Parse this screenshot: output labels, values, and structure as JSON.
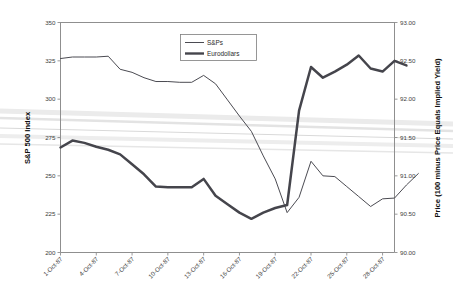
{
  "chart_data": {
    "type": "line",
    "title": "",
    "subtitle": "",
    "xlabel": "",
    "ylabel": "S&P 500 Index",
    "y2label": "Price (100 minus Price Equals Implied Yield)",
    "grid": false,
    "legend_position": "top-center",
    "ylim": [
      200,
      350
    ],
    "y2lim": [
      90.0,
      93.0
    ],
    "yticks": [
      "200",
      "225",
      "250",
      "275",
      "300",
      "325",
      "350"
    ],
    "ytick_values": [
      200,
      225,
      250,
      275,
      300,
      325,
      350
    ],
    "y2ticks": [
      "90.00",
      "90.50",
      "91.00",
      "91.50",
      "92.00",
      "92.50",
      "93.00"
    ],
    "y2tick_values": [
      90.0,
      90.5,
      91.0,
      91.5,
      92.0,
      92.5,
      93.0
    ],
    "xticks": [
      "1-Oct-87",
      "4-Oct-87",
      "7-Oct-87",
      "10-Oct-87",
      "13-Oct-87",
      "16-Oct-87",
      "19-Oct-87",
      "22-Oct-87",
      "25-Oct-87",
      "28-Oct-87"
    ],
    "xtick_index": [
      0,
      3,
      6,
      9,
      12,
      15,
      18,
      21,
      24,
      27
    ],
    "x_count": 29,
    "series": [
      {
        "name": "S&Ps",
        "axis": "left",
        "style": "thin",
        "color": "#4b4b52",
        "values": [
          326.5,
          327.5,
          327.5,
          327.5,
          328.0,
          319.5,
          317.5,
          314.0,
          311.5,
          311.5,
          311.0,
          311.0,
          315.5,
          310.0,
          299.5,
          289.0,
          279.0,
          263.0,
          248.0,
          226.0,
          236.0,
          259.5,
          250.0,
          249.5,
          243.0,
          236.5,
          230.0,
          235.0,
          235.5,
          244.0,
          251.5
        ]
      },
      {
        "name": "Eurodollars",
        "axis": "right",
        "style": "thick",
        "color": "#45454c",
        "values": [
          91.37,
          91.46,
          91.43,
          91.38,
          91.34,
          91.28,
          91.15,
          91.02,
          90.86,
          90.85,
          90.85,
          90.85,
          90.96,
          90.74,
          90.63,
          90.52,
          90.44,
          90.52,
          90.58,
          90.62,
          91.85,
          92.42,
          92.28,
          92.36,
          92.45,
          92.57,
          92.4,
          92.36,
          92.5,
          92.44
        ]
      }
    ],
    "legend": [
      {
        "label": "S&Ps",
        "style": "thin"
      },
      {
        "label": "Eurodollars",
        "style": "thick"
      }
    ]
  }
}
